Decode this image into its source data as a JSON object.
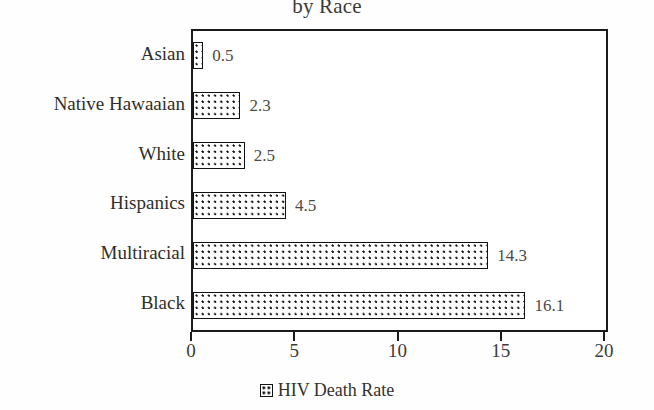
{
  "chart_data": {
    "type": "bar",
    "orientation": "horizontal",
    "title": "by Race",
    "title_clipped": true,
    "categories": [
      "Asian",
      "Native Hawaaian",
      "White",
      "Hispanics",
      "Multiracial",
      "Black"
    ],
    "values": [
      0.5,
      2.3,
      2.5,
      4.5,
      14.3,
      16.1
    ],
    "value_labels": [
      "0.5",
      "2.3",
      "2.5",
      "4.5",
      "14.3",
      "16.1"
    ],
    "series": [
      {
        "name": "HIV Death Rate",
        "values": [
          0.5,
          2.3,
          2.5,
          4.5,
          14.3,
          16.1
        ]
      }
    ],
    "xlabel": "",
    "ylabel": "",
    "xlim": [
      0,
      20
    ],
    "xticks": [
      0,
      5,
      10,
      15,
      20
    ],
    "xtick_labels": [
      "0",
      "5",
      "10",
      "15",
      "20"
    ],
    "grid": false,
    "legend": {
      "position": "bottom",
      "entries": [
        {
          "label": "HIV Death Rate",
          "marker": "dotted-square-swatch"
        }
      ]
    },
    "colors": {
      "bar_fill": "#ffffff",
      "bar_pattern": "#111111",
      "bar_border": "#111111",
      "axis": "#1b1b1b",
      "text": "#2e2e2c"
    }
  }
}
